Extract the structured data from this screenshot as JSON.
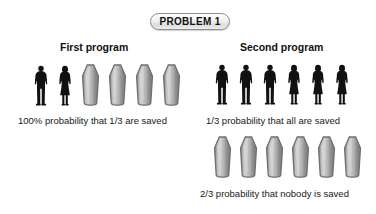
{
  "figure": {
    "width": 376,
    "height": 214,
    "background": "#ffffff"
  },
  "badge": {
    "label": "PROBLEM 1",
    "border_color": "#8d8d8d",
    "text_color": "#111111"
  },
  "columns": [
    {
      "id": "first-program",
      "heading": "First program",
      "rows": [
        {
          "id": "first-program-outcome",
          "icons": [
            "person-male",
            "person-female",
            "coffin",
            "coffin",
            "coffin",
            "coffin"
          ],
          "people": 2,
          "coffins": 4,
          "caption": "100% probability that 1/3 are saved"
        }
      ]
    },
    {
      "id": "second-program",
      "heading": "Second program",
      "rows": [
        {
          "id": "second-program-outcome-a",
          "icons": [
            "person-male",
            "person-male",
            "person-male",
            "person-female",
            "person-female",
            "person-female"
          ],
          "people": 6,
          "coffins": 0,
          "caption": "1/3 probability that all are saved"
        },
        {
          "id": "second-program-outcome-b",
          "icons": [
            "coffin",
            "coffin",
            "coffin",
            "coffin",
            "coffin",
            "coffin"
          ],
          "people": 0,
          "coffins": 6,
          "caption": "2/3 probability that nobody is saved"
        }
      ]
    }
  ],
  "colors": {
    "person_silhouette": "#111111",
    "coffin_fill_light": "#c9c9c9",
    "coffin_fill_dark": "#8e8e8e",
    "coffin_outline": "#6f6f6f",
    "text": "#1a1a1a"
  }
}
